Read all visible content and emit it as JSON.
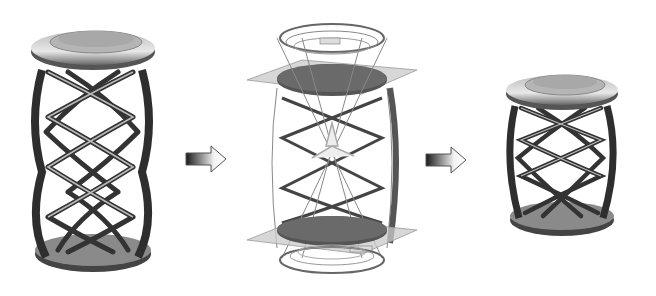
{
  "diagram": {
    "type": "process-flow",
    "background": "#ffffff",
    "stages": [
      {
        "id": "original",
        "name": "original-helix-stand",
        "description": "Tall helical lattice stand with disc top and base",
        "helix_turns_visible": 4,
        "rendering": "shaded-metallic"
      },
      {
        "id": "editing",
        "name": "cad-editing-view",
        "description": "Transparent wireframe with two horizontal section planes and dark cut discs",
        "section_planes": 2,
        "rendering": "wireframe-transparent"
      },
      {
        "id": "result",
        "name": "shortened-helix-stand",
        "description": "Shortened helical lattice stand after removal of middle section",
        "helix_turns_visible": 3,
        "rendering": "shaded-metallic"
      }
    ],
    "arrows": [
      {
        "from": "original",
        "to": "editing",
        "style": "gradient-dark-to-light"
      },
      {
        "from": "editing",
        "to": "result",
        "style": "gradient-dark-to-light"
      }
    ],
    "colors": {
      "metal_dark": "#3a3a3a",
      "metal_mid": "#8a8a8a",
      "metal_light": "#d8d8d8",
      "plane_fill": "#c9c9c9",
      "cut_disc": "#555555",
      "arrow_dark": "#1a1a1a"
    }
  }
}
